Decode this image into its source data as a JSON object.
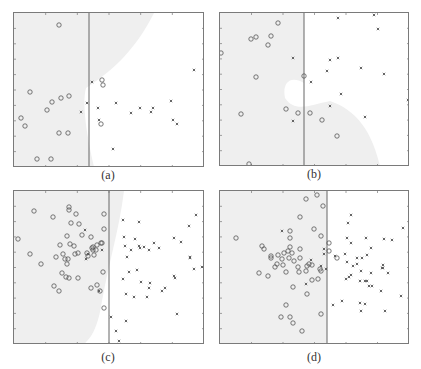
{
  "figure": {
    "panels": [
      {
        "id": "a",
        "caption": "(a)"
      },
      {
        "id": "b",
        "caption": "(b)"
      },
      {
        "id": "c",
        "caption": "(c)"
      },
      {
        "id": "d",
        "caption": "(d)"
      }
    ]
  },
  "colors": {
    "shade": "#efefef",
    "frame": "#7a7a7a",
    "divider": "#666666",
    "marker": "#555555"
  },
  "chart_data": [
    {
      "type": "scatter",
      "title": "(a)",
      "panel_px": {
        "x": 13,
        "y": 12,
        "w": 190,
        "h": 154
      },
      "divider_x": 75,
      "shade_path": "M0,0 L140,0 C120,40 95,60 72,75 C68,90 72,120 80,154 L0,154 Z",
      "series": [
        {
          "name": "class-circle",
          "marker": "o",
          "points": [
            [
              45,
              12
            ],
            [
              16,
              79
            ],
            [
              38,
              89
            ],
            [
              47,
              85
            ],
            [
              55,
              83
            ],
            [
              33,
              97
            ],
            [
              7,
              105
            ],
            [
              11,
              113
            ],
            [
              45,
              120
            ],
            [
              54,
              120
            ],
            [
              23,
              146
            ],
            [
              37,
              146
            ],
            [
              88,
              67
            ],
            [
              89,
              72
            ],
            [
              87,
              111
            ]
          ]
        },
        {
          "name": "class-cross",
          "marker": "x",
          "points": [
            [
              78,
              69
            ],
            [
              73,
              90
            ],
            [
              67,
              99
            ],
            [
              84,
              95
            ],
            [
              85,
              107
            ],
            [
              102,
              90
            ],
            [
              117,
              100
            ],
            [
              126,
              95
            ],
            [
              137,
              99
            ],
            [
              139,
              95
            ],
            [
              157,
              88
            ],
            [
              159,
              107
            ],
            [
              163,
              111
            ],
            [
              180,
              57
            ],
            [
              99,
              136
            ]
          ]
        }
      ],
      "grid": false,
      "legend": null
    },
    {
      "type": "scatter",
      "title": "(b)",
      "panel_px": {
        "x": 219,
        "y": 12,
        "w": 189,
        "h": 153
      },
      "divider_x": 84,
      "shade_path": "M0,0 L84,0 L84,70 C70,62 62,70 65,85 C75,100 90,92 110,88 C130,95 150,110 160,153 L0,153 Z",
      "series": [
        {
          "name": "class-circle",
          "marker": "o",
          "points": [
            [
              58,
              10
            ],
            [
              31,
              26
            ],
            [
              36,
              24
            ],
            [
              51,
              23
            ],
            [
              48,
              32
            ],
            [
              1,
              40
            ],
            [
              36,
              64
            ],
            [
              21,
              101
            ],
            [
              66,
              96
            ],
            [
              78,
              100
            ],
            [
              84,
              63
            ],
            [
              90,
              100
            ],
            [
              102,
              107
            ],
            [
              117,
              123
            ],
            [
              29,
              151
            ]
          ]
        },
        {
          "name": "class-cross",
          "marker": "x",
          "points": [
            [
              118,
              5
            ],
            [
              154,
              2
            ],
            [
              158,
              16
            ],
            [
              73,
              45
            ],
            [
              110,
              47
            ],
            [
              118,
              45
            ],
            [
              107,
              58
            ],
            [
              141,
              55
            ],
            [
              164,
              61
            ],
            [
              91,
              69
            ],
            [
              121,
              81
            ],
            [
              110,
              93
            ],
            [
              145,
              104
            ],
            [
              73,
              108
            ],
            [
              188,
              87
            ]
          ]
        }
      ],
      "grid": false,
      "legend": null
    },
    {
      "type": "scatter",
      "title": "(c)",
      "panel_px": {
        "x": 13,
        "y": 190,
        "w": 190,
        "h": 153
      },
      "divider_x": 95,
      "shade_path": "M0,0 L110,0 C105,40 95,70 88,110 C85,130 80,145 70,153 L0,153 Z",
      "series": [
        {
          "name": "class-circle",
          "marker": "o",
          "points": [
            [
              4,
              48
            ],
            [
              20,
              20
            ],
            [
              39,
              26
            ],
            [
              55,
              16
            ],
            [
              55,
              19
            ],
            [
              62,
              23
            ],
            [
              57,
              32
            ],
            [
              65,
              33
            ],
            [
              90,
              23
            ],
            [
              90,
              38
            ],
            [
              53,
              45
            ],
            [
              68,
              44
            ],
            [
              77,
              46
            ],
            [
              56,
              53
            ],
            [
              46,
              54
            ],
            [
              60,
              55
            ],
            [
              78,
              57
            ],
            [
              64,
              62
            ],
            [
              83,
              54
            ],
            [
              87,
              52
            ],
            [
              88,
              52
            ],
            [
              16,
              63
            ],
            [
              49,
              63
            ],
            [
              61,
              63
            ],
            [
              42,
              66
            ],
            [
              27,
              73
            ],
            [
              51,
              68
            ],
            [
              54,
              68
            ],
            [
              53,
              73
            ],
            [
              48,
              82
            ],
            [
              52,
              86
            ],
            [
              55,
              87
            ],
            [
              64,
              87
            ],
            [
              40,
              95
            ],
            [
              45,
              100
            ],
            [
              77,
              97
            ],
            [
              83,
              94
            ],
            [
              86,
              100
            ],
            [
              89,
              81
            ],
            [
              90,
              117
            ],
            [
              73,
              62
            ],
            [
              74,
              65
            ],
            [
              82,
              59
            ],
            [
              80,
              64
            ],
            [
              79,
              56
            ],
            [
              79,
              59
            ]
          ]
        },
        {
          "name": "class-cross",
          "marker": "x",
          "points": [
            [
              71,
              39
            ],
            [
              88,
              59
            ],
            [
              85,
              100
            ],
            [
              109,
              29
            ],
            [
              125,
              31
            ],
            [
              110,
              46
            ],
            [
              121,
              48
            ],
            [
              111,
              55
            ],
            [
              125,
              55
            ],
            [
              117,
              59
            ],
            [
              113,
              66
            ],
            [
              126,
              57
            ],
            [
              130,
              56
            ],
            [
              135,
              59
            ],
            [
              140,
              52
            ],
            [
              145,
              57
            ],
            [
              160,
              47
            ],
            [
              167,
              51
            ],
            [
              175,
              35
            ],
            [
              182,
              24
            ],
            [
              176,
              66
            ],
            [
              176,
              67
            ],
            [
              180,
              78
            ],
            [
              188,
              76
            ],
            [
              123,
              79
            ],
            [
              115,
              81
            ],
            [
              109,
              88
            ],
            [
              136,
              92
            ],
            [
              135,
              97
            ],
            [
              127,
              91
            ],
            [
              151,
              97
            ],
            [
              160,
              85
            ],
            [
              161,
              87
            ],
            [
              112,
              103
            ],
            [
              120,
              106
            ],
            [
              133,
              106
            ],
            [
              148,
              100
            ],
            [
              163,
              123
            ],
            [
              97,
              126
            ],
            [
              102,
              140
            ],
            [
              112,
              130
            ],
            [
              105,
              150
            ],
            [
              191,
              108
            ],
            [
              72,
              68
            ],
            [
              74,
              63
            ]
          ]
        }
      ],
      "grid": false,
      "legend": null
    },
    {
      "type": "scatter",
      "title": "(d)",
      "panel_px": {
        "x": 219,
        "y": 190,
        "w": 189,
        "h": 153
      },
      "divider_x": 107,
      "shade_path": "M0,0 L107,0 L107,153 L0,153 Z",
      "series": [
        {
          "name": "class-circle",
          "marker": "o",
          "points": [
            [
              16,
              47
            ],
            [
              86,
              8
            ],
            [
              97,
              4
            ],
            [
              103,
              15
            ],
            [
              80,
              26
            ],
            [
              70,
              40
            ],
            [
              70,
              47
            ],
            [
              94,
              38
            ],
            [
              101,
              45
            ],
            [
              109,
              52
            ],
            [
              42,
              55
            ],
            [
              44,
              58
            ],
            [
              51,
              65
            ],
            [
              51,
              67
            ],
            [
              58,
              64
            ],
            [
              64,
              62
            ],
            [
              70,
              56
            ],
            [
              68,
              60
            ],
            [
              72,
              62
            ],
            [
              69,
              67
            ],
            [
              62,
              68
            ],
            [
              57,
              73
            ],
            [
              63,
              74
            ],
            [
              55,
              76
            ],
            [
              80,
              67
            ],
            [
              80,
              58
            ],
            [
              74,
              70
            ],
            [
              78,
              76
            ],
            [
              89,
              73
            ],
            [
              92,
              74
            ],
            [
              87,
              75
            ],
            [
              86,
              80
            ],
            [
              100,
              78
            ],
            [
              101,
              80
            ],
            [
              39,
              82
            ],
            [
              48,
              85
            ],
            [
              66,
              81
            ],
            [
              79,
              81
            ],
            [
              98,
              88
            ],
            [
              92,
              89
            ],
            [
              73,
              96
            ],
            [
              87,
              103
            ],
            [
              66,
              114
            ],
            [
              61,
              126
            ],
            [
              70,
              126
            ],
            [
              73,
              132
            ],
            [
              101,
              123
            ],
            [
              82,
              140
            ],
            [
              109,
              60
            ],
            [
              117,
              67
            ]
          ]
        },
        {
          "name": "class-cross",
          "marker": "x",
          "points": [
            [
              62,
              40
            ],
            [
              104,
              63
            ],
            [
              104,
              58
            ],
            [
              91,
              69
            ],
            [
              101,
              75
            ],
            [
              86,
              93
            ],
            [
              106,
              78
            ],
            [
              115,
              65
            ],
            [
              128,
              32
            ],
            [
              131,
              24
            ],
            [
              127,
              47
            ],
            [
              131,
              52
            ],
            [
              146,
              47
            ],
            [
              151,
              57
            ],
            [
              172,
              49
            ],
            [
              164,
              48
            ],
            [
              183,
              37
            ],
            [
              125,
              63
            ],
            [
              127,
              71
            ],
            [
              133,
              75
            ],
            [
              137,
              67
            ],
            [
              142,
              67
            ],
            [
              137,
              73
            ],
            [
              141,
              80
            ],
            [
              131,
              84
            ],
            [
              126,
              88
            ],
            [
              129,
              86
            ],
            [
              140,
              90
            ],
            [
              145,
              90
            ],
            [
              147,
              90
            ],
            [
              149,
              95
            ],
            [
              152,
              95
            ],
            [
              161,
              100
            ],
            [
              162,
              77
            ],
            [
              163,
              74
            ],
            [
              163,
              77
            ],
            [
              151,
              82
            ],
            [
              147,
              64
            ],
            [
              168,
              82
            ],
            [
              113,
              114
            ],
            [
              122,
              110
            ],
            [
              140,
              112
            ],
            [
              145,
              113
            ],
            [
              141,
              120
            ],
            [
              165,
              120
            ],
            [
              181,
              105
            ]
          ]
        }
      ],
      "grid": false,
      "legend": null
    }
  ]
}
